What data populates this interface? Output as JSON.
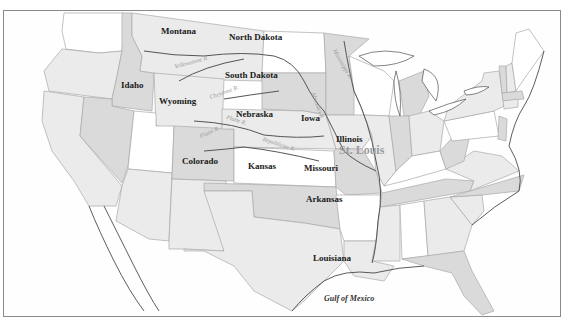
{
  "map": {
    "colors": {
      "white": "#ffffff",
      "light": "#ebebeb",
      "mid": "#dadada",
      "dark": "#c4c4c4",
      "outline": "#a9a9a9",
      "frame": "#8a8a8a"
    },
    "state_labels": {
      "montana": "Montana",
      "north_dakota": "North Dakota",
      "south_dakota": "South Dakota",
      "idaho": "Idaho",
      "wyoming": "Wyoming",
      "nebraska": "Nebraska",
      "iowa": "Iowa",
      "colorado": "Colorado",
      "kansas": "Kansas",
      "illinois": "Illinois",
      "missouri": "Missouri",
      "arkansas": "Arkansas",
      "louisiana": "Louisiana"
    },
    "city_labels": {
      "st_louis": "St. Louis"
    },
    "water_labels": {
      "gulf": "Gulf of Mexico"
    },
    "river_labels": {
      "yellowstone": "Yellowstone R.",
      "cheyenne": "Cheyenne R.",
      "platte": "Platte R.",
      "north_platte": "Platte R.",
      "republican": "Republican R.",
      "mississippi": "Mississippi R.",
      "missouri_r": "Missouri R."
    }
  }
}
